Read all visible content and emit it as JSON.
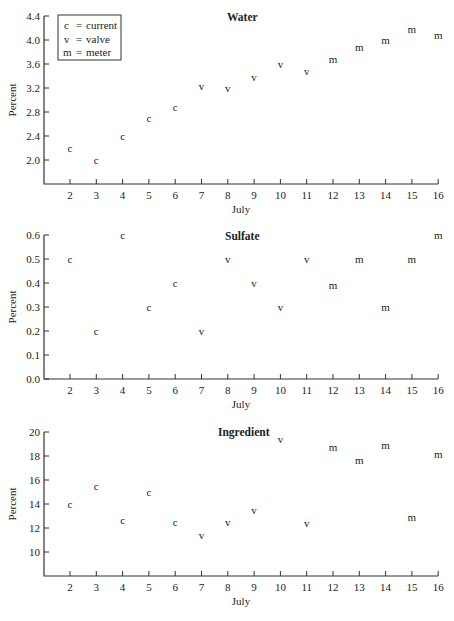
{
  "legend": {
    "entries": [
      {
        "symbol": "c",
        "eq": "=",
        "label": "current"
      },
      {
        "symbol": "v",
        "eq": "=",
        "label": "valve"
      },
      {
        "symbol": "m",
        "eq": "=",
        "label": "meter"
      }
    ]
  },
  "chart_data": [
    {
      "type": "scatter",
      "title": "Water",
      "xlabel": "July",
      "ylabel": "Percent",
      "x": [
        2,
        3,
        4,
        5,
        6,
        7,
        8,
        9,
        10,
        11,
        12,
        13,
        14,
        15,
        16
      ],
      "markers": [
        "c",
        "c",
        "c",
        "c",
        "c",
        "v",
        "v",
        "v",
        "v",
        "v",
        "m",
        "m",
        "m",
        "m",
        "m"
      ],
      "values": [
        2.2,
        2.0,
        2.4,
        2.7,
        2.88,
        3.23,
        3.2,
        3.37,
        3.6,
        3.48,
        3.67,
        3.87,
        4.0,
        4.17,
        4.07
      ],
      "xticks": [
        "2",
        "3",
        "4",
        "5",
        "6",
        "7",
        "8",
        "9",
        "10",
        "11",
        "12",
        "13",
        "14",
        "15",
        "16"
      ],
      "yticks": [
        "2.0",
        "2.4",
        "2.8",
        "3.2",
        "3.6",
        "4.0",
        "4.4"
      ],
      "ytick_values": [
        2.0,
        2.4,
        2.8,
        3.2,
        3.6,
        4.0,
        4.4
      ],
      "ylim": [
        1.6,
        4.4
      ],
      "xlim": [
        1,
        16
      ],
      "grid": false,
      "legend_position": "upper left"
    },
    {
      "type": "scatter",
      "title": "Sulfate",
      "xlabel": "July",
      "ylabel": "Percent",
      "x": [
        2,
        3,
        4,
        5,
        6,
        7,
        8,
        9,
        10,
        11,
        12,
        13,
        14,
        15,
        16
      ],
      "markers": [
        "c",
        "c",
        "c",
        "c",
        "c",
        "v",
        "v",
        "v",
        "v",
        "v",
        "m",
        "m",
        "m",
        "m",
        "m"
      ],
      "values": [
        0.5,
        0.2,
        0.6,
        0.3,
        0.4,
        0.2,
        0.5,
        0.4,
        0.3,
        0.5,
        0.39,
        0.5,
        0.3,
        0.5,
        0.6
      ],
      "xticks": [
        "2",
        "3",
        "4",
        "5",
        "6",
        "7",
        "8",
        "9",
        "10",
        "11",
        "12",
        "13",
        "14",
        "15",
        "16"
      ],
      "yticks": [
        "0.0",
        "0.1",
        "0.2",
        "0.3",
        "0.4",
        "0.5",
        "0.6"
      ],
      "ytick_values": [
        0.0,
        0.1,
        0.2,
        0.3,
        0.4,
        0.5,
        0.6
      ],
      "ylim": [
        0.0,
        0.6
      ],
      "xlim": [
        1,
        16
      ],
      "grid": false
    },
    {
      "type": "scatter",
      "title": "Ingredient",
      "xlabel": "July",
      "ylabel": "Percent",
      "x": [
        2,
        3,
        4,
        5,
        6,
        7,
        8,
        9,
        10,
        11,
        12,
        13,
        14,
        15,
        16
      ],
      "markers": [
        "c",
        "c",
        "c",
        "c",
        "c",
        "v",
        "v",
        "v",
        "v",
        "v",
        "m",
        "m",
        "m",
        "m",
        "m"
      ],
      "values": [
        14.0,
        15.5,
        12.6,
        15.0,
        12.5,
        11.4,
        12.5,
        13.5,
        19.4,
        12.4,
        18.7,
        17.6,
        18.9,
        12.9,
        18.1
      ],
      "xticks": [
        "2",
        "3",
        "4",
        "5",
        "6",
        "7",
        "8",
        "9",
        "10",
        "11",
        "12",
        "13",
        "14",
        "15",
        "16"
      ],
      "yticks": [
        "10",
        "12",
        "14",
        "16",
        "18",
        "20"
      ],
      "ytick_values": [
        10,
        12,
        14,
        16,
        18,
        20
      ],
      "ylim": [
        8,
        20
      ],
      "xlim": [
        1,
        16
      ],
      "grid": false
    }
  ]
}
